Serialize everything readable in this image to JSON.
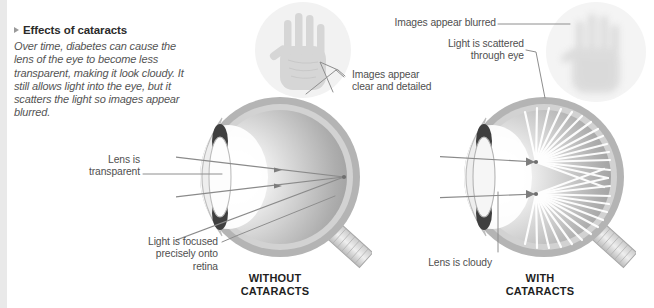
{
  "figure": {
    "heading": "Effects of cataracts",
    "heading_marker_icon": "triangle-right-icon",
    "body": "Over time, diabetes can cause the lens of the eye to become less transparent, making it look cloudy. It still allows light into the eye, but it scatters the light so images appear blurred."
  },
  "panels": {
    "left": {
      "caption_line1": "WITHOUT",
      "caption_line2": "CATARACTS",
      "labels": {
        "lens": "Lens is\ntransparent",
        "focus": "Light is focused\nprecisely onto\nretina",
        "image_quality": "Images appear\nclear and detailed"
      },
      "hand_icon": "sharp-hand-icon"
    },
    "right": {
      "caption_line1": "WITH",
      "caption_line2": "CATARACTS",
      "labels": {
        "lens": "Lens is cloudy",
        "scatter": "Light is scattered\nthrough eye",
        "image_quality": "Images appear blurred"
      },
      "hand_icon": "blurred-hand-icon"
    }
  },
  "colors": {
    "rule": "#e9e9e9",
    "sclera_outer": "#b4b4b4",
    "sclera_inner": "#cfcfcf",
    "vitreous_light": "#f0f0f0",
    "vitreous_dark": "#9d9d9d",
    "iris": "#3f3f3f",
    "lens": "#fdfdfd",
    "ray": "#8a8a8a",
    "scatter_ray": "#ffffff",
    "leader": "#8e8e8e",
    "text": "#4f4f4f",
    "heading": "#2b2b2b"
  }
}
